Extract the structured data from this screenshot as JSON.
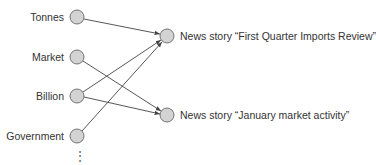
{
  "diagram": {
    "words": [
      {
        "label": "Tonnes",
        "x": 77,
        "y": 17
      },
      {
        "label": "Market",
        "x": 77,
        "y": 57
      },
      {
        "label": "Billion",
        "x": 77,
        "y": 96
      },
      {
        "label": "Government",
        "x": 77,
        "y": 136
      }
    ],
    "stories": [
      {
        "label": "News story “First Quarter Imports Review”",
        "x": 167,
        "y": 36
      },
      {
        "label": "News story “January market activity”",
        "x": 167,
        "y": 115
      }
    ],
    "edges": [
      {
        "from": "Tonnes",
        "to": 0
      },
      {
        "from": "Market",
        "to": 1
      },
      {
        "from": "Billion",
        "to": 0
      },
      {
        "from": "Billion",
        "to": 1
      },
      {
        "from": "Government",
        "to": 0
      }
    ],
    "ellipsis": "⋮",
    "colors": {
      "node_fill": "#d3d3d3",
      "node_stroke": "#666666",
      "edge": "#444444"
    }
  }
}
